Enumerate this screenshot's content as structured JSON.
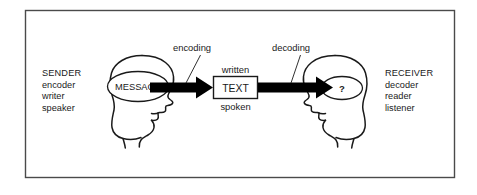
{
  "figure": {
    "type": "communication-model-diagram",
    "frame": {
      "border_color": "#4a4a4a",
      "background": "#ffffff"
    },
    "stroke_color": "#1a1a1a",
    "arrow_color": "#000000"
  },
  "sender": {
    "title": "SENDER",
    "roles": [
      "encoder",
      "writer",
      "speaker"
    ],
    "message_label": "MESSAGE"
  },
  "receiver": {
    "title": "RECEIVER",
    "roles": [
      "decoder",
      "reader",
      "listener"
    ],
    "thought_label": "?"
  },
  "channel": {
    "box_label": "TEXT",
    "above_label": "written",
    "below_label": "spoken"
  },
  "process": {
    "encoding_label": "encoding",
    "decoding_label": "decoding"
  },
  "icons": {
    "sender_head": "head-profile-right-icon",
    "receiver_head": "head-profile-left-icon",
    "encode_arrow": "right-arrow-icon",
    "decode_arrow": "right-arrow-icon"
  }
}
